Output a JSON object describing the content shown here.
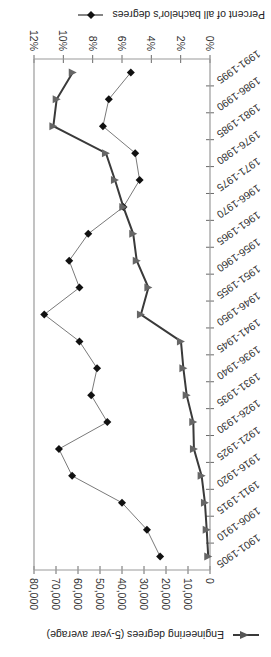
{
  "chart_data": {
    "type": "line",
    "title": "",
    "orientation": "horizontal (category axis vertical), image rotated 180 degrees",
    "categories": [
      "1901-1905",
      "1906-1910",
      "1911-1915",
      "1916-1920",
      "1921-1925",
      "1926-1930",
      "1931-1935",
      "1936-1940",
      "1941-1945",
      "1946-1950",
      "1951-1955",
      "1956-1960",
      "1961-1965",
      "1966-1970",
      "1971-1975",
      "1976-1980",
      "1981-1985",
      "1986-1990",
      "1991-1995"
    ],
    "series": [
      {
        "name": "Engineering degrees (5-year average)",
        "axis": "primary",
        "marker": "triangle",
        "color": "#3a3a3a",
        "values": [
          800,
          1500,
          2300,
          3800,
          7300,
          7600,
          10600,
          12100,
          13200,
          31400,
          28000,
          33300,
          34900,
          39400,
          43200,
          47300,
          71200,
          69700,
          62400
        ]
      },
      {
        "name": "Percent of all bachelor's degrees",
        "axis": "secondary",
        "marker": "diamond",
        "color": "#111111",
        "values": [
          3.4,
          4.3,
          6.0,
          9.4,
          10.3,
          7.0,
          8.1,
          7.7,
          8.9,
          11.3,
          8.9,
          9.6,
          8.3,
          5.9,
          4.8,
          5.1,
          7.3,
          6.9,
          5.4
        ]
      }
    ],
    "primary_axis": {
      "label": "Engineering degrees (5-year average)",
      "range": [
        0,
        80000
      ],
      "ticks": [
        "0",
        "10,000",
        "20,000",
        "30,000",
        "40,000",
        "50,000",
        "60,000",
        "70,000",
        "80,000"
      ]
    },
    "secondary_axis": {
      "label": "Percent of all bachelor's degrees",
      "range": [
        0,
        12
      ],
      "ticks": [
        "0%",
        "2%",
        "4%",
        "6%",
        "8%",
        "10%",
        "12%"
      ]
    },
    "grid": false,
    "legend_position": "outside, one entry above and one below the plot"
  },
  "legend": {
    "engineering": "Engineering degrees (5-year average)",
    "percent": "Percent of all bachelor's degrees"
  }
}
